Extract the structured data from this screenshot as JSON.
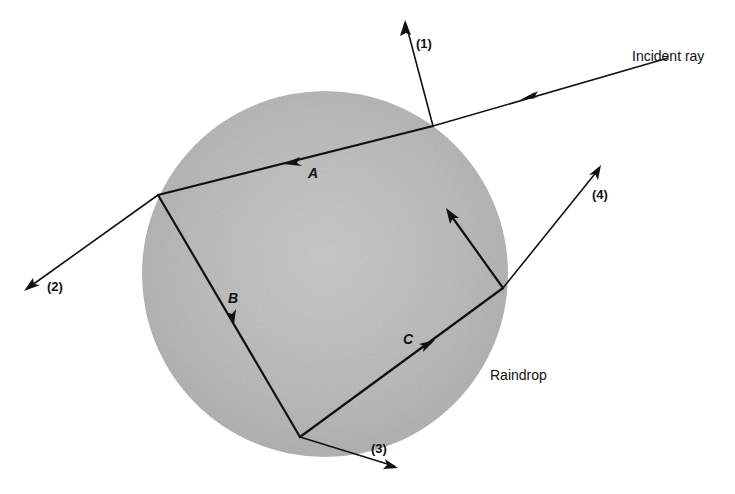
{
  "diagram": {
    "type": "raindrop-ray-path",
    "colors": {
      "drop_fill": "#b9b9b9",
      "drop_center": "#c9c9c9",
      "ray": "#111111",
      "background": "#ffffff"
    },
    "labels": {
      "incident": "Incident ray",
      "raindrop": "Raindrop",
      "ray1": "(1)",
      "ray2": "(2)",
      "ray3": "(3)",
      "ray4": "(4)",
      "segA": "A",
      "segB": "B",
      "segC": "C"
    }
  }
}
